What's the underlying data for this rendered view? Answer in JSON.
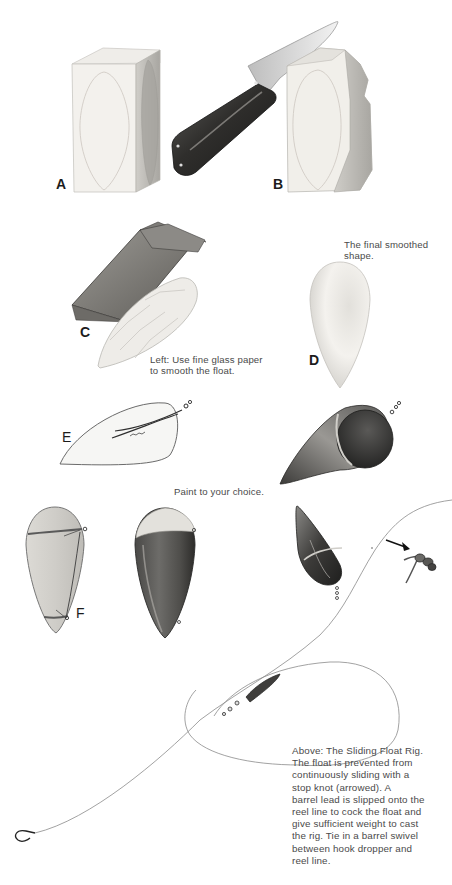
{
  "figure_labels": {
    "a": "A",
    "b": "B",
    "c": "C",
    "d": "D",
    "e": "E",
    "f": "F"
  },
  "captions": {
    "final_shape": [
      "The final smoothed",
      "shape."
    ],
    "glass_paper": [
      "Left: Use fine glass paper",
      "to smooth the float."
    ],
    "paint": "Paint to your choice.",
    "sliding_rig": [
      "Above: The Sliding Float Rig.",
      "The float is prevented from",
      "continuously sliding with a",
      "stop knot (arrowed). A",
      "barrel lead is slipped onto the",
      "reel line to cock the float and",
      "give sufficient weight to cast",
      "the rig. Tie in a barrel swivel",
      "between hook dropper and",
      "reel line."
    ]
  },
  "illustrations": [
    {
      "id": "A",
      "subject": "wood-block-with-outline"
    },
    {
      "id": "B",
      "subject": "knife-carving-block"
    },
    {
      "id": "C",
      "subject": "glass-paper-sanding-float"
    },
    {
      "id": "D",
      "subject": "smoothed-float"
    },
    {
      "id": "E",
      "subject": "wire-eye-insert"
    },
    {
      "id": "F",
      "subject": "whipped-float"
    },
    {
      "id": "painted",
      "subject": "painted-float"
    },
    {
      "id": "rig",
      "subject": "sliding-float-rig"
    }
  ],
  "colors": {
    "ink": "#1c1c1c",
    "caption": "#4a4a4a",
    "wood_light": "#f1efea",
    "wood_shade": "#b9b7b2",
    "dark_paint": "#3a3a38",
    "line": "#8a8a8a"
  }
}
